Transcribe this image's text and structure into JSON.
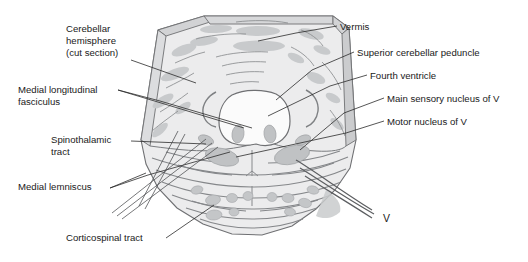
{
  "figure": {
    "background_color": "#ffffff",
    "tissue_fill": "#ececed",
    "tissue_stroke": "#6f7073",
    "cut_edge_fill": "#cfd0d2",
    "nucleus_fill": "#c3c5c7",
    "fiber_stroke": "#8d8f92",
    "ventricle_fill": "#fbfbfb",
    "label_color": "#1a1a1a",
    "leader_color": "#2b2b2b"
  },
  "labels": {
    "left": [
      {
        "name": "cerebellar-hemisphere",
        "lines": [
          "Cerebellar",
          "hemisphere",
          "(cut section)"
        ],
        "x": 66,
        "y": 32,
        "line_height": 12
      },
      {
        "name": "medial-longitudinal-fasciculus",
        "lines": [
          "Medial longitudinal",
          "fasciculus"
        ],
        "x": 18,
        "y": 93,
        "line_height": 12
      },
      {
        "name": "spinothalamic-tract",
        "lines": [
          "Spinothalamic",
          "tract"
        ],
        "x": 51,
        "y": 143,
        "line_height": 12
      },
      {
        "name": "medial-lemniscus",
        "lines": [
          "Medial lemniscus"
        ],
        "x": 18,
        "y": 190,
        "line_height": 12
      },
      {
        "name": "corticospinal-tract",
        "lines": [
          "Corticospinal tract"
        ],
        "x": 66,
        "y": 241,
        "line_height": 12
      }
    ],
    "right": [
      {
        "name": "vermis",
        "lines": [
          "Vermis"
        ],
        "x": 340,
        "y": 28,
        "line_height": 12
      },
      {
        "name": "superior-cerebellar-peduncle",
        "lines": [
          "Superior cerebellar peduncle"
        ],
        "x": 357,
        "y": 54,
        "line_height": 12
      },
      {
        "name": "fourth-ventricle",
        "lines": [
          "Fourth ventricle"
        ],
        "x": 370,
        "y": 78,
        "line_height": 12
      },
      {
        "name": "main-sensory-nucleus-of-v",
        "lines": [
          "Main sensory nucleus of V"
        ],
        "x": 387,
        "y": 101,
        "line_height": 12
      },
      {
        "name": "motor-nucleus-of-v",
        "lines": [
          "Motor nucleus of V"
        ],
        "x": 387,
        "y": 125,
        "line_height": 12
      }
    ],
    "nerve": {
      "name": "trigeminal-nerve-root",
      "text": "V",
      "x": 383,
      "y": 222
    }
  }
}
